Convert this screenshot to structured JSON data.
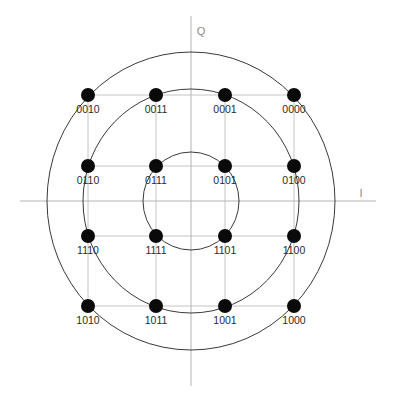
{
  "diagram": {
    "axes": {
      "i_label": "I",
      "q_label": "Q"
    },
    "colors": {
      "background": "#ffffff",
      "axis": "#b4b4b4",
      "grid": "#c4c4c4",
      "ring": "#3a3a3a",
      "point": "#0a0a0a",
      "label": "#2a2a2a"
    },
    "rings": [
      {
        "name": "inner-ring",
        "rx": 48,
        "ry": 49
      },
      {
        "name": "middle-ring",
        "rx": 108,
        "ry": 112
      },
      {
        "name": "outer-ring",
        "rx": 144,
        "ry": 149
      }
    ],
    "points": [
      {
        "code": "0010",
        "col": 0,
        "row": 0
      },
      {
        "code": "0011",
        "col": 1,
        "row": 0
      },
      {
        "code": "0001",
        "col": 2,
        "row": 0
      },
      {
        "code": "0000",
        "col": 3,
        "row": 0
      },
      {
        "code": "0110",
        "col": 0,
        "row": 1
      },
      {
        "code": "0111",
        "col": 1,
        "row": 1
      },
      {
        "code": "0101",
        "col": 2,
        "row": 1
      },
      {
        "code": "0100",
        "col": 3,
        "row": 1
      },
      {
        "code": "1110",
        "col": 0,
        "row": 2
      },
      {
        "code": "1111",
        "col": 1,
        "row": 2
      },
      {
        "code": "1101",
        "col": 2,
        "row": 2
      },
      {
        "code": "1100",
        "col": 3,
        "row": 2
      },
      {
        "code": "1010",
        "col": 0,
        "row": 3
      },
      {
        "code": "1011",
        "col": 1,
        "row": 3
      },
      {
        "code": "1001",
        "col": 2,
        "row": 3
      },
      {
        "code": "1000",
        "col": 3,
        "row": 3
      }
    ]
  }
}
